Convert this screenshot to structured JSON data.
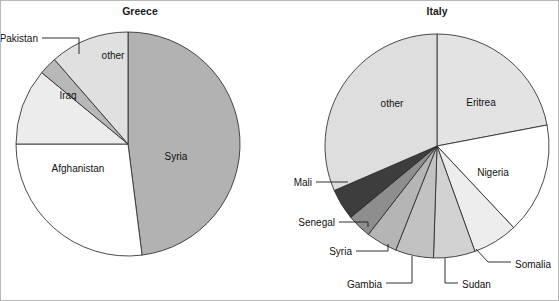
{
  "figure": {
    "width": 559,
    "height": 301,
    "background": "#ffffff",
    "border_color": "#b8b8b8"
  },
  "charts": [
    {
      "id": "greece",
      "title": "Greece",
      "title_x": 140,
      "title_y": 15,
      "cx": 128,
      "cy": 144,
      "r": 112,
      "start_angle": -90,
      "direction": "clockwise",
      "slices": [
        {
          "label": "Syria",
          "value": 48.0,
          "color": "#b2b2b2",
          "label_x": 176,
          "label_y": 160,
          "label_anchor": "middle",
          "callout": false
        },
        {
          "label": "Afghanistan",
          "value": 27.0,
          "color": "#ffffff",
          "label_x": 78,
          "label_y": 172,
          "label_anchor": "middle",
          "callout": false
        },
        {
          "label": "Iraq",
          "value": 11.0,
          "color": "#ececec",
          "label_x": 68,
          "label_y": 99,
          "label_anchor": "middle",
          "callout": false
        },
        {
          "label": "Pakistan",
          "value": 2.6,
          "color": "#b8b8b8",
          "label_x": 38,
          "label_y": 42,
          "label_anchor": "end",
          "callout": true,
          "leader": "M 42,38 L 79,38 L 79,54"
        },
        {
          "label": "other",
          "value": 11.4,
          "color": "#e0e0e0",
          "label_x": 113,
          "label_y": 59,
          "label_anchor": "middle",
          "callout": false
        }
      ]
    },
    {
      "id": "italy",
      "title": "Italy",
      "title_x": 437,
      "title_y": 15,
      "cx": 437,
      "cy": 146,
      "r": 112,
      "start_angle": -90,
      "direction": "clockwise",
      "slices": [
        {
          "label": "Eritrea",
          "value": 22.0,
          "color": "#e3e3e3",
          "label_x": 481,
          "label_y": 106,
          "label_anchor": "middle",
          "callout": false
        },
        {
          "label": "Nigeria",
          "value": 16.0,
          "color": "#ffffff",
          "label_x": 493,
          "label_y": 176,
          "label_anchor": "middle",
          "callout": false
        },
        {
          "label": "Somalia",
          "value": 6.5,
          "color": "#ededed",
          "label_x": 515,
          "label_y": 268,
          "label_anchor": "start",
          "callout": true,
          "leader": "M 476,249 L 488,262 L 511,262"
        },
        {
          "label": "Sudan",
          "value": 6.0,
          "color": "#d2d2d2",
          "label_x": 462,
          "label_y": 288,
          "label_anchor": "start",
          "callout": true,
          "leader": "M 445,258 L 445,283 L 458,283"
        },
        {
          "label": "Gambia",
          "value": 5.5,
          "color": "#c2c2c2",
          "label_x": 382,
          "label_y": 288,
          "label_anchor": "end",
          "callout": true,
          "leader": "M 412,256 L 412,283 L 386,283"
        },
        {
          "label": "Syria",
          "value": 4.5,
          "color": "#b5b5b5",
          "label_x": 352,
          "label_y": 255,
          "label_anchor": "end",
          "callout": true,
          "leader": "M 388,244 L 388,251 L 356,251"
        },
        {
          "label": "Senegal",
          "value": 3.5,
          "color": "#8e8e8e",
          "label_x": 335,
          "label_y": 226,
          "label_anchor": "end",
          "callout": true,
          "leader": "M 368,227 L 368,222 L 339,222"
        },
        {
          "label": "Mali",
          "value": 4.5,
          "color": "#3d3d3d",
          "label_x": 312,
          "label_y": 186,
          "label_anchor": "end",
          "callout": true,
          "leader": "M 348,182 L 316,182"
        },
        {
          "label": "other",
          "value": 31.5,
          "color": "#dedede",
          "label_x": 392,
          "label_y": 107,
          "label_anchor": "middle",
          "callout": false
        }
      ]
    }
  ],
  "chart_data": [
    {
      "type": "pie",
      "title": "Greece",
      "categories": [
        "Syria",
        "Afghanistan",
        "Iraq",
        "Pakistan",
        "other"
      ],
      "values": [
        48.0,
        27.0,
        11.0,
        2.6,
        11.4
      ],
      "unit": "percent",
      "legend": "none (direct slice labels)",
      "notes": "Slices ordered clockwise starting at 12 o'clock."
    },
    {
      "type": "pie",
      "title": "Italy",
      "categories": [
        "Eritrea",
        "Nigeria",
        "Somalia",
        "Sudan",
        "Gambia",
        "Syria",
        "Senegal",
        "Mali",
        "other"
      ],
      "values": [
        22.0,
        16.0,
        6.5,
        6.0,
        5.5,
        4.5,
        3.5,
        4.5,
        31.5
      ],
      "unit": "percent",
      "legend": "none (direct slice labels with leader lines)",
      "notes": "Slices ordered clockwise starting at 12 o'clock."
    }
  ]
}
